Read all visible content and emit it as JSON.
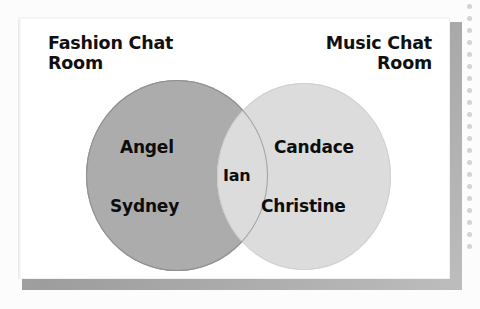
{
  "figure": {
    "kind": "venn-diagram",
    "sets": [
      {
        "id": "left",
        "label": "Fashion Chat\nRoom",
        "fill_color": "#acacac"
      },
      {
        "id": "right",
        "label": "Music Chat\nRoom",
        "fill_color": "#dcdcdc"
      }
    ],
    "regions": {
      "left_only": {
        "members": [
          "Angel",
          "Sydney"
        ]
      },
      "intersection": {
        "members": [
          "Ian"
        ],
        "fill_color": "#dedede"
      },
      "right_only": {
        "members": [
          "Candace",
          "Christine"
        ]
      }
    },
    "members": {
      "angel": "Angel",
      "sydney": "Sydney",
      "ian": "Ian",
      "candace": "Candace",
      "christine": "Christine"
    },
    "frame": {
      "face_color": "#ffffff",
      "bevel_color": "#a8a8a8"
    },
    "page": {
      "background_color": "#fcfcfc",
      "margin_dot_color": "#d3d3d3",
      "margin_dot_count": 21
    }
  }
}
